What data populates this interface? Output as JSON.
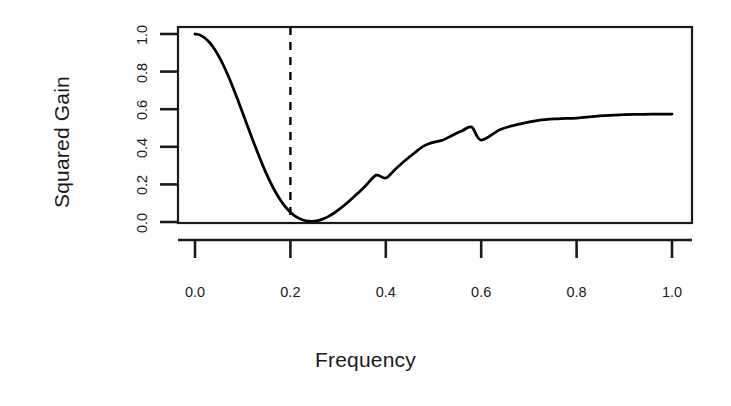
{
  "chart_data": {
    "type": "line",
    "title": "",
    "xlabel": "Frequency",
    "ylabel": "Squared Gain",
    "xlim": [
      0.0,
      1.0
    ],
    "ylim": [
      0.0,
      1.0
    ],
    "grid": false,
    "legend": null,
    "xticks": [
      "0.0",
      "0.2",
      "0.4",
      "0.6",
      "0.8",
      "1.0"
    ],
    "xtick_values": [
      0.0,
      0.2,
      0.4,
      0.6,
      0.8,
      1.0
    ],
    "yticks": [
      "0.0",
      "0.2",
      "0.4",
      "0.6",
      "0.8",
      "1.0"
    ],
    "ytick_values": [
      0.0,
      0.2,
      0.4,
      0.6,
      0.8,
      1.0
    ],
    "series": [
      {
        "name": "squared gain",
        "style": "solid",
        "color": "#000000",
        "x": [
          0.0,
          0.01,
          0.02,
          0.03,
          0.04,
          0.05,
          0.06,
          0.07,
          0.08,
          0.09,
          0.1,
          0.11,
          0.12,
          0.13,
          0.14,
          0.15,
          0.16,
          0.17,
          0.18,
          0.19,
          0.2,
          0.21,
          0.22,
          0.23,
          0.24,
          0.25,
          0.26,
          0.27,
          0.28,
          0.29,
          0.3,
          0.32,
          0.34,
          0.36,
          0.38,
          0.4,
          0.42,
          0.44,
          0.46,
          0.48,
          0.5,
          0.52,
          0.54,
          0.56,
          0.58,
          0.6,
          0.64,
          0.68,
          0.72,
          0.76,
          0.8,
          0.84,
          0.88,
          0.92,
          0.96,
          1.0
        ],
        "y": [
          1.0,
          0.995,
          0.98,
          0.956,
          0.923,
          0.881,
          0.831,
          0.775,
          0.713,
          0.648,
          0.58,
          0.511,
          0.443,
          0.377,
          0.314,
          0.255,
          0.202,
          0.154,
          0.113,
          0.079,
          0.052,
          0.031,
          0.017,
          0.008,
          0.004,
          0.004,
          0.009,
          0.018,
          0.03,
          0.045,
          0.063,
          0.104,
          0.15,
          0.199,
          0.249,
          0.234,
          0.281,
          0.326,
          0.367,
          0.405,
          0.424,
          0.436,
          0.462,
          0.485,
          0.505,
          0.436,
          0.492,
          0.521,
          0.541,
          0.549,
          0.553,
          0.562,
          0.568,
          0.572,
          0.574,
          0.574
        ]
      }
    ],
    "annotations": [
      {
        "name": "notch-frequency-marker",
        "type": "vline",
        "x": 0.2,
        "style": "dashed",
        "color": "#000000",
        "label": ""
      }
    ]
  }
}
